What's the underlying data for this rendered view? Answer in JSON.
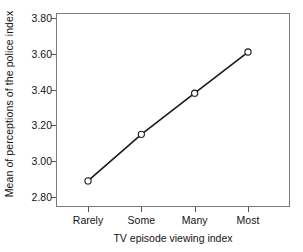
{
  "chart_data": {
    "type": "line",
    "title": "",
    "subtitle": "",
    "xlabel": "TV episode viewing index",
    "ylabel": "Mean of perceptions of the police index",
    "categories": [
      "Rarely",
      "Some",
      "Many",
      "Most"
    ],
    "values": [
      2.89,
      3.15,
      3.38,
      3.61
    ],
    "ylim": [
      2.8,
      3.8
    ],
    "yticks": [
      "2.80",
      "3.00",
      "3.20",
      "3.40",
      "3.60",
      "3.80"
    ],
    "ytick_values": [
      2.8,
      3.0,
      3.2,
      3.4,
      3.6,
      3.8
    ],
    "grid": false,
    "legend": "none",
    "marker": "open-circle",
    "line_color": "#1a1a1a",
    "marker_fill": "#ffffff",
    "marker_edge_color": "#1a1a1a",
    "frame_color": "#7a7a7a",
    "background": "#ffffff",
    "series": [
      {
        "name": "Mean of perceptions of the police index",
        "values": [
          2.89,
          3.15,
          3.38,
          3.61
        ]
      }
    ],
    "points": [
      {
        "x": "Rarely",
        "y": 2.89
      },
      {
        "x": "Some",
        "y": 3.15
      },
      {
        "x": "Many",
        "y": 3.38
      },
      {
        "x": "Most",
        "y": 3.61
      }
    ]
  }
}
